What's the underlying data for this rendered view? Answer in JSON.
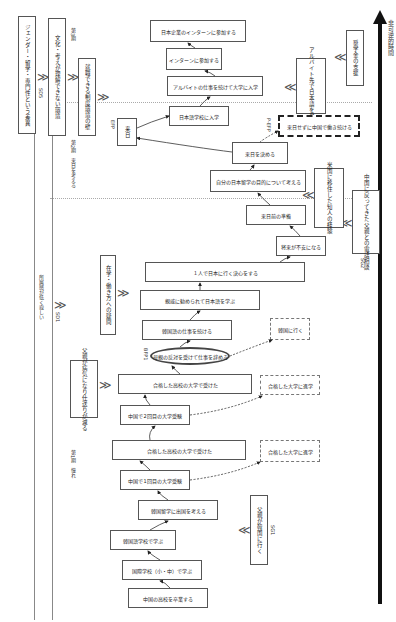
{
  "axis": {
    "label": "非可逆的時間"
  },
  "periods": [
    {
      "label": "第1期　憧れ"
    },
    {
      "label": "第2期　来日を考える"
    },
    {
      "label": "第3期"
    }
  ],
  "sd": [
    {
      "id": "SD1",
      "label": "所属感が低く寂しい"
    },
    {
      "id": "SD2",
      "label": "父親が病気になり仕送りが減る"
    },
    {
      "id": "SD3",
      "label": "在学・働き方への疑問"
    },
    {
      "id": "SD4",
      "label": "文化・考えが理解できない環境"
    },
    {
      "id": "SD5",
      "label": "ジェンダー・留学・専門性という差異"
    },
    {
      "id": "SD6",
      "label": "就職できる制度環境の壁"
    }
  ],
  "sg": [
    {
      "id": "SG1",
      "label": "父親が韓国に行く"
    },
    {
      "id": "SG2",
      "label": "中国に戻ってきた父親との電話相談"
    },
    {
      "id": "SG3",
      "label": "米国に移住した知人の経験"
    },
    {
      "id": "SG4",
      "label": "アルバイト先で日本語を習得"
    },
    {
      "id": "SG5",
      "label": "奨学金の支援"
    }
  ],
  "path": [
    "中国の高校を卒業する",
    "国際学校（小・中）で学ぶ",
    "韓国語学校で学ぶ",
    "韓国留学に出国を考える",
    "中国で1回目の大学受験",
    "合格した高校の大学で受けた",
    "中国で2回目の大学受験",
    "合格した高校の大学で受けた",
    "母親の反対を受けて仕事を辞める",
    "韓国語の仕事を続ける",
    "親戚に勧められて日本語を学ぶ",
    "１人で日本に行く決心をする",
    "将来が不安になる",
    "来日前の準備",
    "自分の日本留学の目的について考える",
    "来日を決める",
    "来日",
    "日本語学校に入学",
    "アルバイトの仕事を続けて大学に入学",
    "インターンに参加する",
    "日本企業のインターンに参加する"
  ],
  "alternatives": [
    "合格した大学に進学",
    "合格した大学に進学",
    "韓国に行く",
    "来日せずに中国で働き続ける"
  ],
  "bfp": [
    {
      "id": "BFP1",
      "label": "母親の反対を受けて仕事を辞める"
    },
    {
      "id": "BFP2",
      "label": "来日"
    }
  ],
  "efp": {
    "id": "EFP",
    "label": "来日"
  },
  "p_efp": {
    "id": "P-EFP",
    "label": "来日せずに中国で働き続ける"
  }
}
